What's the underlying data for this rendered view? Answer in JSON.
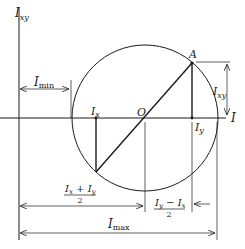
{
  "diagram": {
    "labels": {
      "vertical_axis": {
        "main": "I",
        "sub": "xy"
      },
      "horizontal_axis": "I",
      "center": "O",
      "point_a": "A",
      "ix": {
        "main": "I",
        "sub": "x"
      },
      "iy": {
        "main": "I",
        "sub": "y"
      },
      "imin": {
        "main": "I",
        "sub": "min"
      },
      "imax": {
        "main": "I",
        "sub": "max"
      },
      "ixy_dim": {
        "main": "I",
        "sub": "xy"
      },
      "avg_num": "Iₓ + Iᵧ",
      "avg_num_parts": {
        "a_main": "I",
        "a_sub": "x",
        "op": " + ",
        "b_main": "I",
        "b_sub": "y"
      },
      "avg_den": "2",
      "half_diff_parts": {
        "a_main": "I",
        "a_sub": "y",
        "op": " − ",
        "b_main": "I",
        "b_sub": "x"
      },
      "half_diff_den": "2"
    },
    "colors": {
      "ink": "#1a1a1a",
      "background": "#ffffff"
    }
  }
}
